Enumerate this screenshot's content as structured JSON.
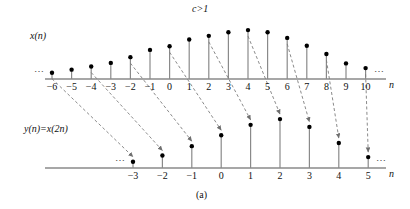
{
  "figure": {
    "caption": "(a)",
    "top_label": "c>1",
    "upper_signal_label": "x(n)",
    "lower_signal_label": "y(n)=x(2n)",
    "upper_axis_label": "n",
    "lower_axis_label": "n",
    "ellipsis": "⋯"
  },
  "chart_data": {
    "type": "scatter",
    "title": "c>1",
    "xlabel": "n",
    "ylabel": "",
    "grid": false,
    "legend": null,
    "panels": [
      {
        "name": "upper-stem-plot",
        "label": "x(n)",
        "axis_label": "n",
        "xlim": [
          -7,
          11
        ],
        "ylim": [
          0,
          1
        ],
        "x": [
          -6,
          -5,
          -4,
          -3,
          -2,
          -1,
          0,
          1,
          2,
          3,
          4,
          5,
          6,
          7,
          8,
          9,
          10
        ],
        "values": [
          0.12,
          0.18,
          0.24,
          0.31,
          0.42,
          0.56,
          0.63,
          0.76,
          0.83,
          0.9,
          0.94,
          0.9,
          0.79,
          0.64,
          0.48,
          0.3,
          0.21
        ],
        "tick_labels": [
          "−6",
          "−5",
          "−4",
          "−3",
          "−2",
          "−1",
          "0",
          "1",
          "2",
          "3",
          "4",
          "5",
          "6",
          "7",
          "8",
          "9",
          "10"
        ],
        "left_ellipsis": "⋯",
        "right_ellipsis": "⋯"
      },
      {
        "name": "lower-stem-plot",
        "label": "y(n)=x(2n)",
        "axis_label": "n",
        "xlim": [
          -4.5,
          9
        ],
        "ylim": [
          0,
          1
        ],
        "x": [
          -3,
          -2,
          -1,
          0,
          1,
          2,
          3,
          4,
          5
        ],
        "values": [
          0.12,
          0.24,
          0.42,
          0.63,
          0.83,
          0.94,
          0.79,
          0.48,
          0.21
        ],
        "tick_labels": [
          "−3",
          "−2",
          "−1",
          "0",
          "1",
          "2",
          "3",
          "4",
          "5"
        ],
        "left_ellipsis": "⋯",
        "right_ellipsis": "⋯"
      }
    ],
    "mappings": [
      {
        "from_n": -6,
        "to_n": -3
      },
      {
        "from_n": -4,
        "to_n": -2
      },
      {
        "from_n": -2,
        "to_n": -1
      },
      {
        "from_n": 0,
        "to_n": 0
      },
      {
        "from_n": 2,
        "to_n": 1
      },
      {
        "from_n": 4,
        "to_n": 2
      },
      {
        "from_n": 6,
        "to_n": 3
      },
      {
        "from_n": 8,
        "to_n": 4
      },
      {
        "from_n": 10,
        "to_n": 5
      }
    ],
    "annotations": [
      "c>1",
      "(a)"
    ]
  },
  "colors": {
    "axis": "#8a8a8a",
    "stem": "#8a8a8a",
    "marker": "#000000",
    "arrow": "#7d7d7d",
    "text": "#1a1a1a"
  }
}
